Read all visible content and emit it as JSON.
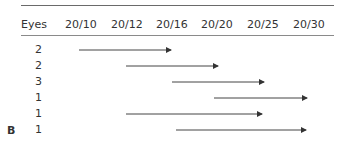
{
  "table": {
    "column_header": "Eyes",
    "acuity_headers": [
      "20/10",
      "20/12",
      "20/16",
      "20/20",
      "20/25",
      "20/30"
    ],
    "rows": [
      {
        "eyes": "2",
        "from": "20/10",
        "to": "20/16"
      },
      {
        "eyes": "2",
        "from": "20/12",
        "to": "20/20"
      },
      {
        "eyes": "3",
        "from": "20/16",
        "to": "20/25"
      },
      {
        "eyes": "1",
        "from": "20/20",
        "to": "20/30"
      },
      {
        "eyes": "1",
        "from": "20/12",
        "to": "20/25"
      },
      {
        "eyes": "1",
        "from": "20/16",
        "to": "20/30"
      }
    ]
  },
  "panel_label": "B"
}
